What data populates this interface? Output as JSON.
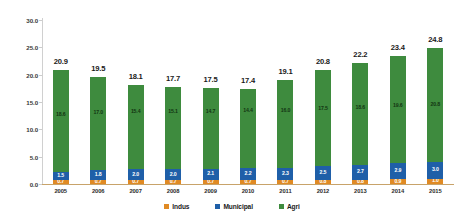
{
  "chart_data": {
    "type": "bar",
    "subtype": "stacked-vertical",
    "title": "",
    "subtitle": "",
    "xlabel": "",
    "ylabel": "",
    "ylim": [
      0.0,
      30.0
    ],
    "ytick_step": 5.0,
    "ytick_labels": [
      "30.0",
      "25.0",
      "20.0",
      "15.0",
      "10.0",
      "5.0",
      "0.0"
    ],
    "ytick_values": [
      30.0,
      25.0,
      20.0,
      15.0,
      10.0,
      5.0,
      0.0
    ],
    "grid": false,
    "legend_position": "bottom-center",
    "categories": [
      "2005",
      "2006",
      "2007",
      "2008",
      "2009",
      "2010",
      "2011",
      "2012",
      "2013",
      "2014",
      "2015"
    ],
    "series": [
      {
        "name": "Indus",
        "color": "#e08a24",
        "values": [
          0.7,
          0.7,
          0.7,
          0.7,
          0.7,
          0.7,
          0.7,
          0.8,
          0.8,
          0.9,
          1.0
        ],
        "labels": [
          "0.7",
          "0.7",
          "0.7",
          "0.7",
          "0.7",
          "0.7",
          "0.7",
          "0.8",
          "0.8",
          "0.9",
          "1.0"
        ]
      },
      {
        "name": "Municipal",
        "color": "#1f5fa8",
        "values": [
          1.5,
          1.8,
          2.0,
          2.0,
          2.1,
          2.2,
          2.3,
          2.5,
          2.7,
          2.9,
          3.0
        ],
        "labels": [
          "1.5",
          "1.8",
          "2.0",
          "2.0",
          "2.1",
          "2.2",
          "2.3",
          "2.5",
          "2.7",
          "2.9",
          "3.0"
        ]
      },
      {
        "name": "Agri",
        "color": "#3e8b3e",
        "values": [
          18.6,
          17.0,
          15.4,
          15.1,
          14.7,
          14.4,
          16.0,
          17.5,
          18.6,
          19.6,
          20.8
        ],
        "labels": [
          "18.6",
          "17.0",
          "15.4",
          "15.1",
          "14.7",
          "14.4",
          "16.0",
          "17.5",
          "18.6",
          "19.6",
          "20.8"
        ]
      }
    ],
    "totals": [
      20.9,
      19.5,
      18.1,
      17.7,
      17.5,
      17.4,
      19.1,
      20.8,
      22.2,
      23.4,
      24.8
    ],
    "total_labels": [
      "20.9",
      "19.5",
      "18.1",
      "17.7",
      "17.5",
      "17.4",
      "19.1",
      "20.8",
      "22.2",
      "23.4",
      "24.8"
    ]
  },
  "legend": {
    "items": [
      {
        "label": "Indus",
        "color": "#e08a24"
      },
      {
        "label": "Municipal",
        "color": "#1f5fa8"
      },
      {
        "label": "Agri",
        "color": "#3e8b3e"
      }
    ]
  },
  "colors": {
    "agri": "#3e8b3e",
    "municipal": "#1f5fa8",
    "indus": "#e08a24",
    "axis": "#c8a36a",
    "y_axis": "#d0d0d0",
    "text": "#1a1a1a",
    "background": "#ffffff"
  }
}
